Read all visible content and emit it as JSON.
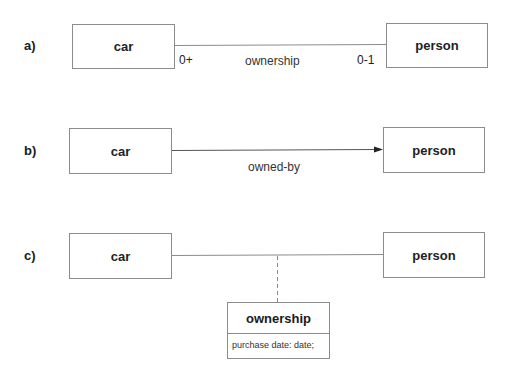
{
  "diagrams": {
    "a": {
      "label": "a)",
      "left_entity": "car",
      "right_entity": "person",
      "relationship": "ownership",
      "left_multiplicity": "0+",
      "right_multiplicity": "0-1"
    },
    "b": {
      "label": "b)",
      "left_entity": "car",
      "right_entity": "person",
      "relationship": "owned-by",
      "arrow": "right"
    },
    "c": {
      "label": "c)",
      "left_entity": "car",
      "right_entity": "person",
      "association_class": {
        "name": "ownership",
        "attributes": [
          "purchase date: date;"
        ]
      }
    }
  },
  "colors": {
    "line": "#8c8c8c",
    "text": "#1a1a1a",
    "background": "#ffffff"
  }
}
